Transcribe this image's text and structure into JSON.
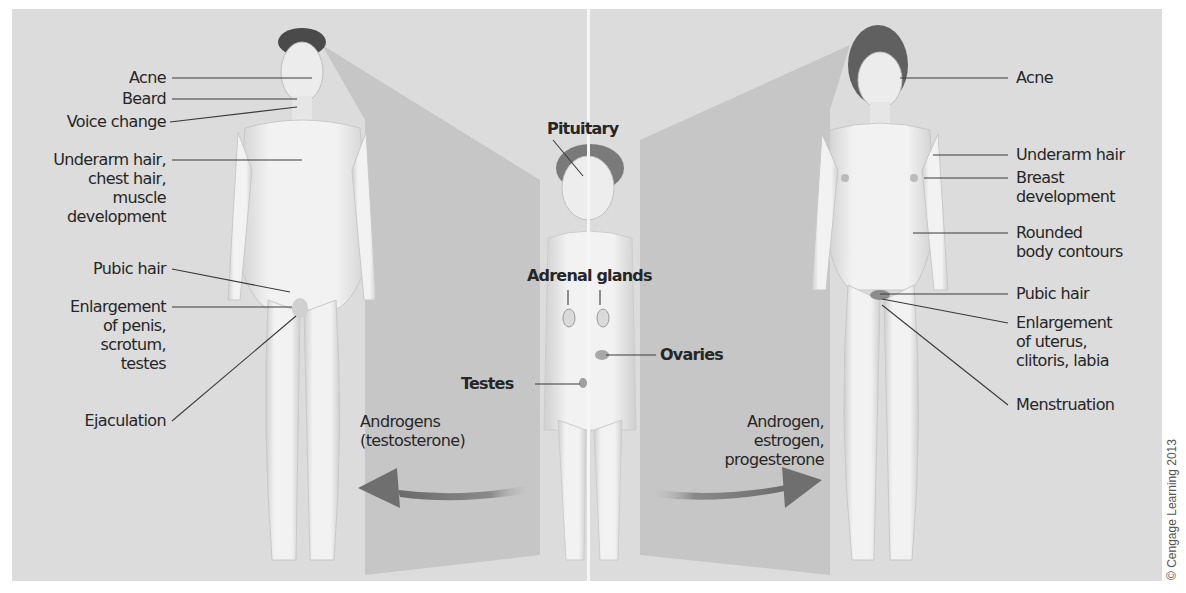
{
  "figure": {
    "colors": {
      "background": "#dcdcdc",
      "shadow_wedge": "#c4c4c4",
      "arrow": "#6f6f6f",
      "text": "#262626",
      "leader_line": "#3a3a3a"
    },
    "male": {
      "labels": [
        {
          "text": "Acne"
        },
        {
          "text": "Beard"
        },
        {
          "text": "Voice change"
        },
        {
          "text": "Underarm hair,\nchest hair,\nmuscle\ndevelopment"
        },
        {
          "text": "Pubic hair"
        },
        {
          "text": "Enlargement\nof penis,\nscrotum,\ntestes"
        },
        {
          "text": "Ejaculation"
        }
      ],
      "hormone_label": "Androgens\n(testosterone)"
    },
    "child": {
      "labels": [
        {
          "text": "Pituitary"
        },
        {
          "text": "Adrenal glands"
        },
        {
          "text": "Testes"
        },
        {
          "text": "Ovaries"
        }
      ]
    },
    "female": {
      "labels": [
        {
          "text": "Acne"
        },
        {
          "text": "Underarm hair"
        },
        {
          "text": "Breast\ndevelopment"
        },
        {
          "text": "Rounded\nbody contours"
        },
        {
          "text": "Pubic hair"
        },
        {
          "text": "Enlargement\nof uterus,\nclitoris, labia"
        },
        {
          "text": "Menstruation"
        }
      ],
      "hormone_label": "Androgen,\nestrogen,\nprogesterone"
    },
    "copyright": "© Cengage Learning 2013"
  }
}
